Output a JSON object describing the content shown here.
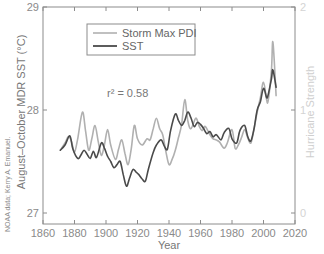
{
  "chart_data": {
    "type": "line",
    "title": "",
    "xlabel": "Year",
    "ylabel": "August–October MDR SST (°C)",
    "ylabel_right": "Hurricane Strength",
    "xlim": [
      1860,
      2020
    ],
    "ylim": [
      27,
      29
    ],
    "ylim_right": [
      0,
      2
    ],
    "x_ticks": [
      "1860",
      "1880",
      "1900",
      "1920",
      "1940",
      "1960",
      "1980",
      "2000",
      "2020"
    ],
    "y_ticks": [
      "27",
      "28",
      "29"
    ],
    "y_ticks_right": [
      "0",
      "1",
      "2"
    ],
    "grid": false,
    "legend_position": "upper-left",
    "annotation": "r² = 0.58",
    "credit": "NOAA data; Kerry A. Emanuel.",
    "series": [
      {
        "name": "Storm Max PDI",
        "axis": "right",
        "color": "#b0b0b0",
        "x": [
          1871,
          1874,
          1876,
          1878,
          1880,
          1882,
          1885,
          1887,
          1889,
          1891,
          1893,
          1895,
          1897,
          1899,
          1901,
          1903,
          1906,
          1908,
          1910,
          1912,
          1914,
          1916,
          1918,
          1920,
          1923,
          1926,
          1928,
          1930,
          1932,
          1934,
          1936,
          1938,
          1940,
          1942,
          1944,
          1946,
          1948,
          1950,
          1952,
          1954,
          1957,
          1959,
          1961,
          1963,
          1966,
          1968,
          1970,
          1972,
          1975,
          1977,
          1980,
          1982,
          1984,
          1986,
          1988,
          1990,
          1992,
          1994,
          1996,
          1998,
          2000,
          2002,
          2003,
          2005,
          2006,
          2008
        ],
        "values": [
          0.61,
          0.68,
          0.74,
          0.7,
          0.59,
          0.72,
          0.98,
          0.8,
          0.61,
          0.72,
          0.85,
          0.7,
          0.56,
          0.66,
          0.81,
          0.66,
          0.52,
          0.62,
          0.71,
          0.58,
          0.47,
          0.62,
          0.85,
          0.72,
          0.66,
          0.72,
          0.71,
          0.82,
          0.92,
          0.82,
          0.76,
          0.6,
          0.47,
          0.52,
          0.61,
          0.73,
          0.86,
          1.1,
          0.89,
          0.82,
          0.92,
          0.85,
          0.8,
          0.84,
          0.76,
          0.72,
          0.71,
          0.69,
          0.63,
          0.68,
          0.81,
          0.63,
          0.66,
          0.73,
          0.81,
          0.73,
          0.68,
          0.82,
          0.98,
          1.12,
          1.27,
          1.1,
          1.09,
          1.38,
          1.66,
          1.14
        ]
      },
      {
        "name": "SST",
        "axis": "left",
        "color": "#4a4a4a",
        "x": [
          1871,
          1874,
          1877,
          1879,
          1882,
          1884,
          1886,
          1888,
          1890,
          1892,
          1894,
          1897,
          1899,
          1901,
          1903,
          1905,
          1907,
          1909,
          1911,
          1913,
          1915,
          1917,
          1919,
          1921,
          1923,
          1925,
          1927,
          1930,
          1932,
          1935,
          1937,
          1939,
          1941,
          1944,
          1946,
          1948,
          1950,
          1952,
          1954,
          1956,
          1958,
          1960,
          1962,
          1964,
          1966,
          1968,
          1970,
          1973,
          1975,
          1978,
          1980,
          1983,
          1985,
          1988,
          1990,
          1992,
          1994,
          1996,
          1998,
          2000,
          2002,
          2003,
          2005,
          2006,
          2008
        ],
        "values": [
          27.61,
          27.66,
          27.75,
          27.62,
          27.53,
          27.56,
          27.61,
          27.57,
          27.53,
          27.6,
          27.54,
          27.68,
          27.63,
          27.55,
          27.5,
          27.44,
          27.47,
          27.5,
          27.37,
          27.26,
          27.34,
          27.42,
          27.4,
          27.37,
          27.33,
          27.31,
          27.43,
          27.59,
          27.66,
          27.71,
          27.65,
          27.62,
          27.8,
          27.96,
          27.9,
          27.85,
          27.9,
          27.98,
          27.92,
          27.84,
          27.88,
          27.86,
          27.82,
          27.77,
          27.79,
          27.74,
          27.76,
          27.71,
          27.78,
          27.82,
          27.72,
          27.68,
          27.8,
          27.85,
          27.74,
          27.7,
          27.82,
          28.0,
          28.08,
          28.21,
          28.12,
          28.15,
          28.3,
          28.39,
          28.22
        ]
      }
    ]
  },
  "legend": {
    "items": [
      {
        "label": "Storm Max PDI",
        "color": "#b0b0b0"
      },
      {
        "label": "SST",
        "color": "#4a4a4a"
      }
    ]
  }
}
